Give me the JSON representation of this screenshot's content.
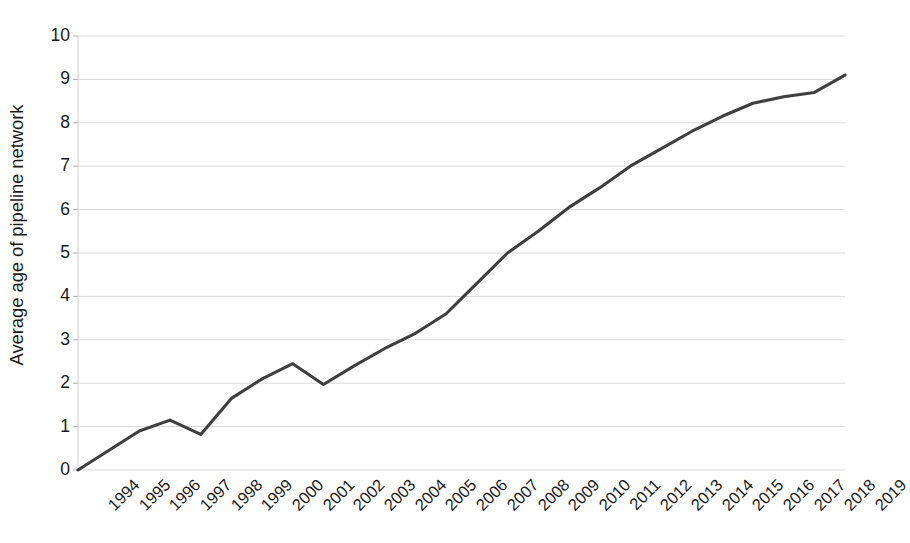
{
  "chart_data": {
    "type": "line",
    "title": "",
    "xlabel": "",
    "ylabel": "Average age of pipeline network",
    "categories": [
      "1994",
      "1995",
      "1996",
      "1997",
      "1998",
      "1999",
      "2000",
      "2001",
      "2002",
      "2003",
      "2004",
      "2005",
      "2006",
      "2007",
      "2008",
      "2009",
      "2010",
      "2011",
      "2012",
      "2013",
      "2014",
      "2015",
      "2016",
      "2017",
      "2018",
      "2019"
    ],
    "values": [
      0.0,
      0.45,
      0.9,
      1.15,
      0.82,
      1.65,
      2.1,
      2.45,
      1.97,
      2.4,
      2.8,
      3.15,
      3.6,
      4.3,
      5.0,
      5.5,
      6.05,
      6.5,
      7.0,
      7.4,
      7.8,
      8.15,
      8.45,
      8.6,
      8.7,
      9.1
    ],
    "series": [
      {
        "name": "Average age of pipeline network",
        "color": "#3f3f3f",
        "values": [
          0.0,
          0.45,
          0.9,
          1.15,
          0.82,
          1.65,
          2.1,
          2.45,
          1.97,
          2.4,
          2.8,
          3.15,
          3.6,
          4.3,
          5.0,
          5.5,
          6.05,
          6.5,
          7.0,
          7.4,
          7.8,
          8.15,
          8.45,
          8.6,
          8.7,
          9.1
        ]
      }
    ],
    "y_ticks": [
      0,
      1,
      2,
      3,
      4,
      5,
      6,
      7,
      8,
      9,
      10
    ],
    "ylim": [
      0,
      10
    ],
    "grid": true,
    "grid_color": "#d9d9d9",
    "legend": "none",
    "x_label_rotation": -45,
    "line_width": 3.1,
    "axis_color": "#d0d0d0",
    "background": "#ffffff"
  }
}
